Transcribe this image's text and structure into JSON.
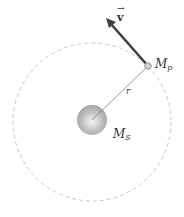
{
  "diagram": {
    "labels": {
      "velocity": "v",
      "velocity_arrow": "→",
      "planet_mass": "M",
      "planet_mass_sub": "p",
      "radius": "r",
      "sun_mass": "M",
      "sun_mass_sub": "S"
    },
    "colors": {
      "orbit": "#c8c8c8",
      "velocity_arrow": "#404040",
      "radius_line": "#8a8a8a",
      "sun": "#a8a8a8",
      "planet": "#b8b8b8"
    },
    "geometry": {
      "orbit_center": [
        92,
        122
      ],
      "orbit_radius": 79,
      "sun_radius": 15,
      "planet_position": [
        148,
        66
      ],
      "velocity_tip": [
        107,
        20
      ]
    }
  }
}
